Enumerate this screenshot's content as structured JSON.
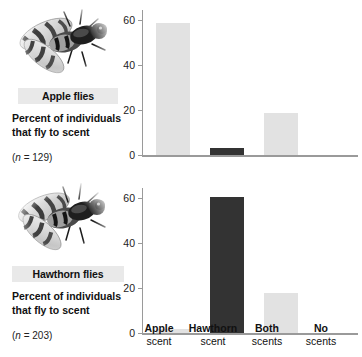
{
  "figure": {
    "x_categories": [
      {
        "line1": "Apple",
        "line2": "scent"
      },
      {
        "line1": "Hawthorn",
        "line2": "scent"
      },
      {
        "line1": "Both",
        "line2": "scents"
      },
      {
        "line1": "No",
        "line2": "scents"
      }
    ]
  },
  "panels": [
    {
      "species_label": "Apple flies",
      "axis_title": "Percent of individuals that fly to scent",
      "sample_size_prefix": "(",
      "sample_size_n": "n",
      "sample_size_value": " = 129)",
      "fly_image_name": "apple-fly-photo"
    },
    {
      "species_label": "Hawthorn flies",
      "axis_title": "Percent of individuals that fly to scent",
      "sample_size_prefix": "(",
      "sample_size_n": "n",
      "sample_size_value": " = 203)",
      "fly_image_name": "hawthorn-fly-photo"
    }
  ],
  "chart_data": [
    {
      "type": "bar",
      "title": "Apple flies",
      "xlabel": "",
      "ylabel": "Percent of individuals that fly to scent",
      "categories": [
        "Apple scent",
        "Hawthorn scent",
        "Both scents",
        "No scents"
      ],
      "values": [
        59,
        3,
        19,
        0
      ],
      "bar_colors": [
        "#e2e2e2",
        "#333333",
        "#e2e2e2",
        "#e2e2e2"
      ],
      "ylim": [
        0,
        65
      ],
      "yticks": [
        0,
        20,
        40,
        60
      ],
      "ytick_labels": [
        "0",
        "20",
        "40",
        "60"
      ],
      "grid": false,
      "legend": "none",
      "sample_size": 129
    },
    {
      "type": "bar",
      "title": "Hawthorn flies",
      "xlabel": "",
      "ylabel": "Percent of individuals that fly to scent",
      "categories": [
        "Apple scent",
        "Hawthorn scent",
        "Both scents",
        "No scents"
      ],
      "values": [
        2,
        61,
        18,
        0
      ],
      "bar_colors": [
        "#e2e2e2",
        "#333333",
        "#e2e2e2",
        "#e2e2e2"
      ],
      "ylim": [
        0,
        65
      ],
      "yticks": [
        0,
        20,
        40,
        60
      ],
      "ytick_labels": [
        "0",
        "20",
        "40",
        "60"
      ],
      "grid": false,
      "legend": "none",
      "sample_size": 203
    }
  ]
}
